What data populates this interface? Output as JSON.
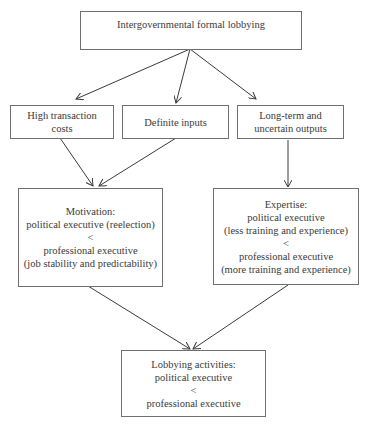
{
  "diagram": {
    "nodes": {
      "root": {
        "lines": [
          "Intergovernmental formal lobbying"
        ]
      },
      "cost": {
        "lines": [
          "High transaction",
          "costs"
        ]
      },
      "inputs": {
        "lines": [
          "Definite inputs"
        ]
      },
      "outputs": {
        "lines": [
          "Long-term and",
          "uncertain outputs"
        ]
      },
      "motivation": {
        "lines": [
          "Motivation:",
          "political executive (reelection)",
          "<",
          "professional executive",
          "(job stability and predictability)"
        ]
      },
      "expertise": {
        "lines": [
          "Expertise:",
          "political executive",
          "(less training and experience)",
          "<",
          "professional executive",
          "(more training and experience)"
        ]
      },
      "lobbying": {
        "lines": [
          "Lobbying activities:",
          "political executive",
          "<",
          "professional executive"
        ]
      }
    },
    "edges": [
      {
        "from": "root",
        "to": "cost"
      },
      {
        "from": "root",
        "to": "inputs"
      },
      {
        "from": "root",
        "to": "outputs"
      },
      {
        "from": "cost",
        "to": "motivation"
      },
      {
        "from": "inputs",
        "to": "motivation"
      },
      {
        "from": "outputs",
        "to": "expertise"
      },
      {
        "from": "motivation",
        "to": "lobbying"
      },
      {
        "from": "expertise",
        "to": "lobbying"
      }
    ],
    "colors": {
      "line": "#3a3a3a",
      "border": "#6f6f6f",
      "text": "#3a3a3a"
    }
  }
}
